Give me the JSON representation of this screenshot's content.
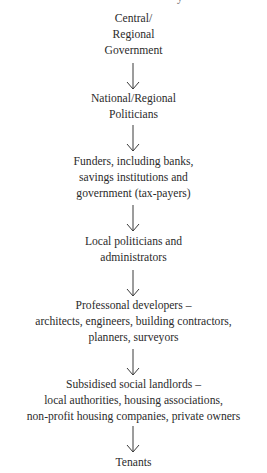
{
  "diagram": {
    "type": "vertical-flow",
    "top_cutoff_text": "y",
    "nodes": [
      {
        "id": "central-government",
        "lines": [
          "Central/",
          "Regional",
          "Government"
        ]
      },
      {
        "id": "national-politicians",
        "lines": [
          "National/Regional",
          "Politicians"
        ]
      },
      {
        "id": "funders",
        "lines": [
          "Funders, including banks,",
          "savings institutions and",
          "government (tax-payers)"
        ]
      },
      {
        "id": "local-politicians",
        "lines": [
          "Local politicians and",
          "administrators"
        ]
      },
      {
        "id": "professional-developers",
        "lines": [
          "Professonal developers –",
          "architects, engineers, building contractors,",
          "planners, surveyors"
        ]
      },
      {
        "id": "social-landlords",
        "lines": [
          "Subsidised social landlords –",
          "local authorities, housing associations,",
          "non-profit housing companies, private owners"
        ]
      },
      {
        "id": "tenants",
        "lines": [
          "Tenants"
        ]
      }
    ],
    "edges": [
      {
        "from": "central-government",
        "to": "national-politicians",
        "icon": "down-arrow-icon"
      },
      {
        "from": "national-politicians",
        "to": "funders",
        "icon": "down-arrow-icon"
      },
      {
        "from": "funders",
        "to": "local-politicians",
        "icon": "down-arrow-icon"
      },
      {
        "from": "local-politicians",
        "to": "professional-developers",
        "icon": "down-arrow-icon"
      },
      {
        "from": "professional-developers",
        "to": "social-landlords",
        "icon": "down-arrow-icon"
      },
      {
        "from": "social-landlords",
        "to": "tenants",
        "icon": "down-arrow-icon"
      }
    ],
    "colors": {
      "text": "#2b2b2b",
      "arrow": "#3a3a3a",
      "background": "#ffffff"
    }
  }
}
